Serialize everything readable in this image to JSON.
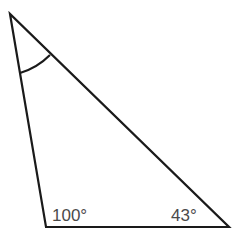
{
  "diagram": {
    "type": "triangle",
    "stroke_color": "#1a1a1a",
    "label_color": "#4a4a4a",
    "vertices": {
      "top": [
        10,
        14
      ],
      "bottom_left": [
        46,
        227
      ],
      "bottom_right": [
        229,
        227
      ]
    },
    "angles": {
      "bottom_left": "100°",
      "bottom_right": "43°",
      "top": "unknown (arc marked)"
    },
    "labels": {
      "bottom_left": "100°",
      "bottom_right": "43°"
    }
  }
}
